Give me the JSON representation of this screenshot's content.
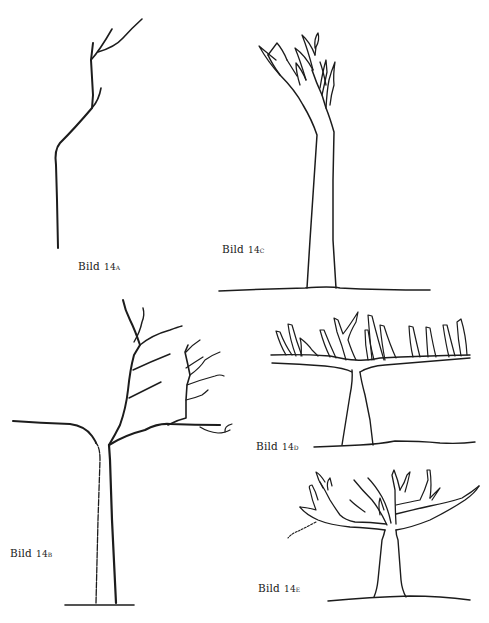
{
  "page": {
    "type": "scanned book page",
    "background": "#ffffff",
    "ink_color": "#1c1c1c"
  },
  "figures": [
    {
      "id": "14a",
      "label": "Bild",
      "number": "14a",
      "description": "young tree whip with thin trunk bending left, two small forks at top"
    },
    {
      "id": "14b",
      "label": "Bild",
      "number": "14b",
      "description": "tree with straight trunk, long horizontal left limb, right limb with upward branch and several side shoots"
    },
    {
      "id": "14c",
      "label": "Bild",
      "number": "14c",
      "description": "tall slender trunk with narrow upright crown of tapering shoots"
    },
    {
      "id": "14d",
      "label": "Bild",
      "number": "14d",
      "description": "short trunk with flat T-shaped horizontal framework and many upright shoots"
    },
    {
      "id": "14e",
      "label": "Bild",
      "number": "14e",
      "description": "spreading tree with short trunk and broad branched crown"
    }
  ]
}
